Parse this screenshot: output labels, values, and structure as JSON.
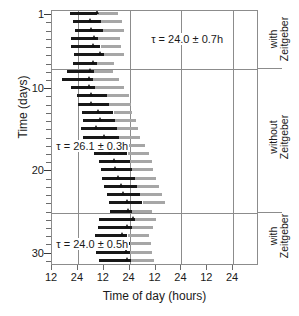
{
  "chart_data": {
    "type": "bar",
    "chart_kind": "double-plotted actogram",
    "title": "",
    "xlabel": "Time of day (hours)",
    "ylabel": "Time (days)",
    "xlim": [
      12,
      108
    ],
    "xtick_values": [
      12,
      24,
      36,
      48,
      60,
      72,
      84,
      96
    ],
    "xtick_labels": [
      "12",
      "24",
      "12",
      "24",
      "12",
      "24",
      "12",
      "24"
    ],
    "ylim": [
      0.5,
      31.5
    ],
    "ytick_major_values": [
      1,
      10,
      20,
      30
    ],
    "ytick_major_labels": [
      "1",
      "10",
      "20",
      "30"
    ],
    "ytick_minor_values": [
      2,
      3,
      4,
      5,
      6,
      7,
      8,
      9,
      11,
      12,
      13,
      14,
      15,
      16,
      17,
      18,
      19,
      21,
      22,
      23,
      24,
      25,
      26,
      27,
      28,
      29,
      31
    ],
    "y_inverted": true,
    "grid": "vertical gridlines at each 24h tick",
    "gridline_values": [
      24,
      48,
      72,
      96
    ],
    "legend_position": "none",
    "series": [
      {
        "name": "activity-bout-dark",
        "color": "#181818",
        "label": "dark activity bar"
      },
      {
        "name": "activity-bout-light",
        "color": "#a6a6a6",
        "label": "light/secondary activity bar"
      },
      {
        "name": "phase-marker",
        "color": "#101010",
        "label": "triangular phase marker"
      }
    ],
    "phase_dividers": [
      7.6,
      25.0
    ],
    "days": [
      {
        "day": 1,
        "dark_start": 20.5,
        "dark_end": 33.0,
        "light_start": 33.0,
        "light_end": 42.5,
        "marker": 33.2
      },
      {
        "day": 2,
        "dark_start": 21.5,
        "dark_end": 34.5,
        "light_start": 34.5,
        "light_end": 44.5,
        "marker": 30.0
      },
      {
        "day": 3,
        "dark_start": 22.5,
        "dark_end": 35.5,
        "light_start": 35.5,
        "light_end": 45.5,
        "marker": 30.3
      },
      {
        "day": 4,
        "dark_start": 21.0,
        "dark_end": 33.5,
        "light_start": 33.5,
        "light_end": 43.5,
        "marker": 31.5
      },
      {
        "day": 5,
        "dark_start": 21.0,
        "dark_end": 34.5,
        "light_start": 34.5,
        "light_end": 44.0,
        "marker": 31.0
      },
      {
        "day": 6,
        "dark_start": 22.0,
        "dark_end": 36.0,
        "light_start": 36.0,
        "light_end": 45.5,
        "marker": 34.5
      },
      {
        "day": 7,
        "dark_start": 21.5,
        "dark_end": 33.0,
        "light_start": 33.0,
        "light_end": 41.0,
        "marker": 31.0
      },
      {
        "day": 8,
        "dark_start": 19.0,
        "dark_end": 31.5,
        "light_start": 31.5,
        "light_end": 40.5,
        "marker": 30.0
      },
      {
        "day": 9,
        "dark_start": 16.5,
        "dark_end": 31.0,
        "light_start": 31.0,
        "light_end": 43.0,
        "marker": 29.5
      },
      {
        "day": 10,
        "dark_start": 21.0,
        "dark_end": 32.0,
        "light_start": 32.0,
        "light_end": 45.5,
        "marker": 29.5
      },
      {
        "day": 11,
        "dark_start": 23.5,
        "dark_end": 37.5,
        "light_start": 37.5,
        "light_end": 47.5,
        "marker": 30.5
      },
      {
        "day": 12,
        "dark_start": 24.0,
        "dark_end": 38.5,
        "light_start": 38.5,
        "light_end": 48.5,
        "marker": 30.5
      },
      {
        "day": 13,
        "dark_start": 26.0,
        "dark_end": 40.5,
        "light_start": 40.5,
        "light_end": 49.0,
        "marker": 33.5
      },
      {
        "day": 14,
        "dark_start": 26.5,
        "dark_end": 41.0,
        "light_start": 41.0,
        "light_end": 51.0,
        "marker": 34.5
      },
      {
        "day": 15,
        "dark_start": 25.5,
        "dark_end": 42.0,
        "light_start": 42.0,
        "light_end": 52.0,
        "marker": 32.5
      },
      {
        "day": 16,
        "dark_start": 26.5,
        "dark_end": 43.0,
        "light_start": 43.0,
        "light_end": 53.0,
        "marker": 36.5
      },
      {
        "day": 17,
        "dark_start": 28.5,
        "dark_end": 45.0,
        "light_start": 45.0,
        "light_end": 55.0,
        "marker": 37.5
      },
      {
        "day": 18,
        "dark_start": 31.5,
        "dark_end": 47.0,
        "light_start": 47.0,
        "light_end": 57.0,
        "marker": 39.0
      },
      {
        "day": 19,
        "dark_start": 34.0,
        "dark_end": 48.0,
        "light_start": 48.0,
        "light_end": 58.5,
        "marker": 41.0
      },
      {
        "day": 20,
        "dark_start": 34.5,
        "dark_end": 49.0,
        "light_start": 49.0,
        "light_end": 59.0,
        "marker": 41.5
      },
      {
        "day": 21,
        "dark_start": 35.0,
        "dark_end": 50.5,
        "light_start": 50.5,
        "light_end": 60.0,
        "marker": 43.0
      },
      {
        "day": 22,
        "dark_start": 36.0,
        "dark_end": 51.5,
        "light_start": 51.5,
        "light_end": 61.5,
        "marker": 44.0
      },
      {
        "day": 23,
        "dark_start": 37.5,
        "dark_end": 53.0,
        "light_start": 53.0,
        "light_end": 63.0,
        "marker": 45.0
      },
      {
        "day": 24,
        "dark_start": 38.5,
        "dark_end": 54.0,
        "light_start": 54.0,
        "light_end": 64.5,
        "marker": 47.0
      },
      {
        "day": 25,
        "dark_start": 39.0,
        "dark_end": 49.0,
        "light_start": 49.0,
        "light_end": 58.5,
        "marker": 47.5
      },
      {
        "day": 26,
        "dark_start": 34.0,
        "dark_end": 50.5,
        "light_start": 50.5,
        "light_end": 60.0,
        "marker": 50.0
      },
      {
        "day": 27,
        "dark_start": 33.5,
        "dark_end": 49.0,
        "light_start": 49.0,
        "light_end": 59.0,
        "marker": 47.0
      },
      {
        "day": 28,
        "dark_start": 32.0,
        "dark_end": 47.0,
        "light_start": 47.0,
        "light_end": 57.0,
        "marker": 44.5
      },
      {
        "day": 29,
        "dark_start": 32.5,
        "dark_end": 48.0,
        "light_start": 48.0,
        "light_end": 58.0,
        "marker": 46.0
      },
      {
        "day": 30,
        "dark_start": 32.5,
        "dark_end": 48.0,
        "light_start": 48.0,
        "light_end": 58.5,
        "marker": 46.5
      },
      {
        "day": 31,
        "dark_start": 34.0,
        "dark_end": 48.5,
        "light_start": 48.5,
        "light_end": 59.5,
        "marker": 47.0
      }
    ],
    "annotations": [
      {
        "id": "tau-top",
        "text": "τ = 24.0 ± 0.7h",
        "tau": 24.0,
        "error": 0.7,
        "unit": "h",
        "day_pos": 4,
        "x_pos": 58
      },
      {
        "id": "tau-middle",
        "text": "τ = 26.1 ± 0.3h",
        "tau": 26.1,
        "error": 0.3,
        "unit": "h",
        "day_pos": 17,
        "x_pos": 14
      },
      {
        "id": "tau-bottom",
        "text": "τ = 24.0 ± 0.5h",
        "tau": 24.0,
        "error": 0.5,
        "unit": "h",
        "day_pos": 29,
        "x_pos": 14
      }
    ],
    "phase_regions": [
      {
        "id": "phase-1",
        "line1": "with",
        "line2": "Zeitgeber",
        "day_start": 1,
        "day_end": 7
      },
      {
        "id": "phase-2",
        "line1": "without",
        "line2": "Zeitgeber",
        "day_start": 8,
        "day_end": 24
      },
      {
        "id": "phase-3",
        "line1": "with",
        "line2": "Zeitgeber",
        "day_start": 25,
        "day_end": 31
      }
    ],
    "colors": {
      "bar_dark": "#181818",
      "bar_light": "#a6a6a6",
      "marker": "#101010",
      "axis": "#8c8c8c",
      "text": "#1a1a1a",
      "background": "#ffffff"
    }
  }
}
